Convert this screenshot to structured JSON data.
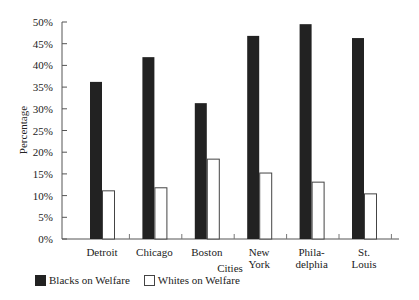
{
  "chart_data": {
    "type": "bar",
    "title": "",
    "xlabel": "Cities",
    "ylabel": "Percentage",
    "categories": [
      "Detroit",
      "Chicago",
      "Boston",
      "New\nYork",
      "Phila-\ndelphia",
      "St.\nLouis"
    ],
    "series": [
      {
        "name": "Blacks on Welfare",
        "color": "#222222",
        "values": [
          36.2,
          41.9,
          31.3,
          46.8,
          49.5,
          46.3
        ]
      },
      {
        "name": "Whites on Welfare",
        "color": "#ffffff",
        "values": [
          11.1,
          11.8,
          18.4,
          15.2,
          13.1,
          10.4
        ]
      }
    ],
    "ylim": [
      0,
      50
    ],
    "yticks": [
      "0%",
      "5%",
      "10%",
      "15%",
      "20%",
      "25%",
      "30%",
      "35%",
      "40%",
      "45%",
      "50%"
    ],
    "grid": false,
    "legend_position": "bottom-left"
  },
  "legend": {
    "items": [
      {
        "label": "Blacks on Welfare",
        "swatch": "black"
      },
      {
        "label": "Whites on Welfare",
        "swatch": "white"
      }
    ]
  }
}
